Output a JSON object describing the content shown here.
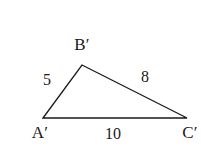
{
  "figure": {
    "kind": "geometry-diagram",
    "shape": "triangle",
    "background_color": "#ffffff",
    "stroke_color": "#1a1a1a",
    "stroke_width": 1.3,
    "width": 211,
    "height": 163
  },
  "vertices": [
    {
      "id": "A",
      "label": "A′",
      "x": 43,
      "y": 118
    },
    {
      "id": "B",
      "label": "B′",
      "x": 82,
      "y": 65
    },
    {
      "id": "C",
      "label": "C′",
      "x": 187,
      "y": 118
    }
  ],
  "sides": [
    {
      "id": "AB",
      "from": "A",
      "to": "B",
      "label": "5",
      "label_x": 47,
      "label_y": 79
    },
    {
      "id": "BC",
      "from": "B",
      "to": "C",
      "label": "8",
      "label_x": 145,
      "label_y": 77
    },
    {
      "id": "AC",
      "from": "A",
      "to": "C",
      "label": "10",
      "label_x": 113,
      "label_y": 133
    }
  ],
  "chart_data": {
    "type": "diagram",
    "title": "",
    "shape": "triangle",
    "labels": {
      "vertices": [
        "A′",
        "B′",
        "C′"
      ],
      "side_lengths": [
        "5",
        "8",
        "10"
      ]
    },
    "side_length_values": [
      5,
      8,
      10
    ],
    "annotations": [
      {
        "text": "B′",
        "role": "vertex-label"
      },
      {
        "text": "5",
        "role": "side-length"
      },
      {
        "text": "8",
        "role": "side-length"
      },
      {
        "text": "A′",
        "role": "vertex-label"
      },
      {
        "text": "10",
        "role": "side-length"
      },
      {
        "text": "C′",
        "role": "vertex-label"
      }
    ]
  }
}
